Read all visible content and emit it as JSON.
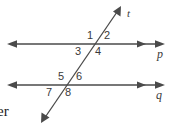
{
  "figure": {
    "stroke_color": "#4a4a4a",
    "text_color": "#3a3a3a",
    "background_color": "#ffffff",
    "lines": [
      {
        "id": "p",
        "label": "p",
        "type": "horizontal-parallel-line",
        "y": 44
      },
      {
        "id": "q",
        "label": "q",
        "type": "horizontal-parallel-line",
        "y": 85
      },
      {
        "id": "t",
        "label": "t",
        "type": "transversal-line"
      }
    ],
    "angles": [
      {
        "id": "1",
        "label": "1"
      },
      {
        "id": "2",
        "label": "2"
      },
      {
        "id": "3",
        "label": "3"
      },
      {
        "id": "4",
        "label": "4"
      },
      {
        "id": "5",
        "label": "5"
      },
      {
        "id": "6",
        "label": "6"
      },
      {
        "id": "7",
        "label": "7"
      },
      {
        "id": "8",
        "label": "8"
      }
    ],
    "edge_text": "er"
  }
}
